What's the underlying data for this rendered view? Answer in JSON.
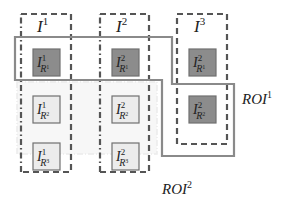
{
  "colors": {
    "dashed_box": "#555555",
    "roi_outline": "#8a8a8a",
    "dark_cell_fill": "#8c8c8c",
    "light_cell_fill": "#ececec",
    "cell_border": "#707070",
    "text": "#222222"
  },
  "images": [
    {
      "id": "I1",
      "base": "I",
      "sup": "1"
    },
    {
      "id": "I2",
      "base": "I",
      "sup": "2"
    },
    {
      "id": "I3",
      "base": "I",
      "sup": "3"
    }
  ],
  "cells": [
    {
      "col": 1,
      "row": 1,
      "base": "I",
      "sup": "1",
      "sub": "R",
      "subsup": "1",
      "highlight": true
    },
    {
      "col": 1,
      "row": 2,
      "base": "I",
      "sup": "1",
      "sub": "R",
      "subsup": "2",
      "highlight": false
    },
    {
      "col": 1,
      "row": 3,
      "base": "I",
      "sup": "1",
      "sub": "R",
      "subsup": "3",
      "highlight": false
    },
    {
      "col": 2,
      "row": 1,
      "base": "I",
      "sup": "2",
      "sub": "R",
      "subsup": "1",
      "highlight": true
    },
    {
      "col": 2,
      "row": 2,
      "base": "I",
      "sup": "2",
      "sub": "R",
      "subsup": "2",
      "highlight": false
    },
    {
      "col": 2,
      "row": 3,
      "base": "I",
      "sup": "2",
      "sub": "R",
      "subsup": "3",
      "highlight": false
    },
    {
      "col": 3,
      "row": 1,
      "base": "I",
      "sup": "2",
      "sub": "R",
      "subsup": "1",
      "highlight": true
    },
    {
      "col": 3,
      "row": 2,
      "base": "I",
      "sup": "2",
      "sub": "R",
      "subsup": "2",
      "highlight": true
    }
  ],
  "roi_labels": [
    {
      "id": "ROI1",
      "base": "ROI",
      "sup": "1"
    },
    {
      "id": "ROI2",
      "base": "ROI",
      "sup": "2"
    }
  ]
}
